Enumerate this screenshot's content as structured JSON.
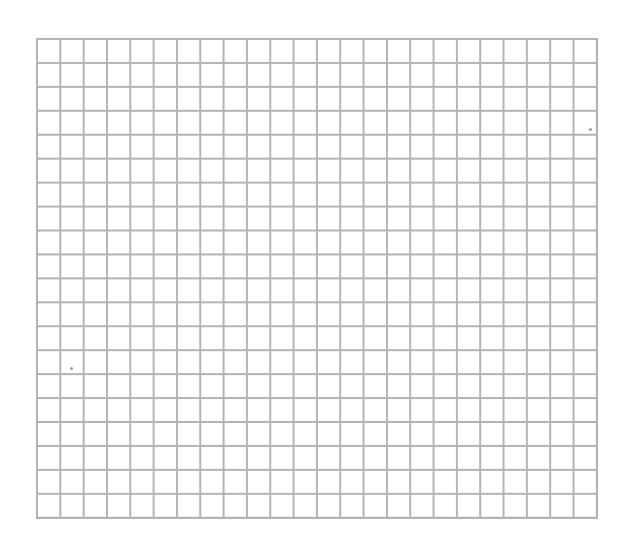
{
  "page": {
    "type": "blank grid paper",
    "background_color": "#ffffff",
    "line_color": "#b3b3b3"
  },
  "grid": {
    "columns": 24,
    "rows": 20,
    "left": 36,
    "top": 38,
    "right": 598,
    "bottom": 519,
    "cell_width": 23.35,
    "cell_height": 24
  },
  "specks": [
    {
      "x": 70,
      "y": 367
    },
    {
      "x": 589,
      "y": 128
    }
  ]
}
